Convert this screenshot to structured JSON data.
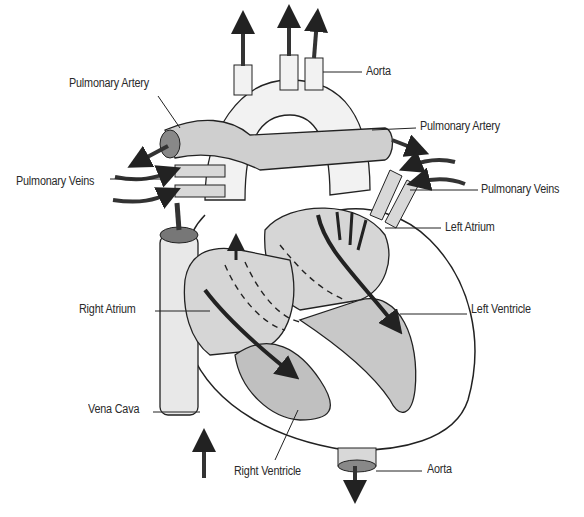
{
  "diagram": {
    "colors": {
      "ink": "#222222",
      "shade": "#9a9a9a",
      "chamber": "#d6d6d6",
      "background": "#ffffff"
    },
    "labels": [
      {
        "id": "pulmonary-artery-left",
        "text": "Pulmonary Artery",
        "x": 69,
        "y": 76
      },
      {
        "id": "aorta-top",
        "text": "Aorta",
        "x": 366,
        "y": 64
      },
      {
        "id": "pulmonary-artery-right",
        "text": "Pulmonary Artery",
        "x": 420,
        "y": 119
      },
      {
        "id": "pulmonary-veins-left",
        "text": "Pulmonary Veins",
        "x": 16,
        "y": 174
      },
      {
        "id": "pulmonary-veins-right",
        "text": "Pulmonary Veins",
        "x": 481,
        "y": 182
      },
      {
        "id": "left-atrium",
        "text": "Left Atrium",
        "x": 445,
        "y": 220
      },
      {
        "id": "right-atrium",
        "text": "Right Atrium",
        "x": 79,
        "y": 302
      },
      {
        "id": "left-ventricle",
        "text": "Left Ventricle",
        "x": 471,
        "y": 302
      },
      {
        "id": "vena-cava",
        "text": "Vena Cava",
        "x": 88,
        "y": 402
      },
      {
        "id": "right-ventricle",
        "text": "Right Ventricle",
        "x": 234,
        "y": 464
      },
      {
        "id": "aorta-bottom",
        "text": "Aorta",
        "x": 427,
        "y": 462
      }
    ]
  }
}
